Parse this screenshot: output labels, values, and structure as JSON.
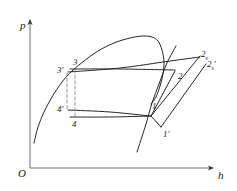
{
  "figure": {
    "type": "thermodynamic-ph-diagram",
    "background_color": "#ffffff",
    "line_color": "#262626",
    "dashed_color": "#7a7a7a"
  },
  "axes": {
    "y_label": "p",
    "x_label": "h",
    "origin_label": "O",
    "y_arrow": "up-arrow",
    "x_arrow": "right-arrow"
  },
  "point_labels": [
    {
      "id": "3prime",
      "text": "3",
      "prime": "′",
      "sub": "",
      "x": 57,
      "y": 66
    },
    {
      "id": "3",
      "text": "3",
      "prime": "",
      "sub": "",
      "x": 73,
      "y": 58
    },
    {
      "id": "4prime",
      "text": "4",
      "prime": "′",
      "sub": "",
      "x": 57,
      "y": 105
    },
    {
      "id": "4",
      "text": "4",
      "prime": "",
      "sub": "",
      "x": 72,
      "y": 120
    },
    {
      "id": "1",
      "text": "1",
      "prime": "",
      "sub": "",
      "x": 152,
      "y": 102
    },
    {
      "id": "1prime",
      "text": "1",
      "prime": "′",
      "sub": "",
      "x": 163,
      "y": 130
    },
    {
      "id": "2",
      "text": "2",
      "prime": "",
      "sub": "",
      "x": 178,
      "y": 72
    },
    {
      "id": "2s",
      "text": "2",
      "prime": "",
      "sub": "s",
      "x": 201,
      "y": 50
    },
    {
      "id": "2sprime",
      "text": "2",
      "prime": "′",
      "sub": "s",
      "x": 207,
      "y": 60
    }
  ],
  "chart_data": {
    "type": "line",
    "title": "",
    "xlabel": "h",
    "ylabel": "p",
    "grid": false,
    "legend": "none",
    "series": [
      {
        "name": "saturation-dome",
        "comment": "two-phase dome: saturated liquid branch left, saturated vapour branch right",
        "points": [
          [
            34,
            143
          ],
          [
            38,
            127
          ],
          [
            44,
            112
          ],
          [
            52,
            97
          ],
          [
            62,
            82
          ],
          [
            72,
            71
          ],
          [
            84,
            61
          ],
          [
            98,
            51
          ],
          [
            114,
            43
          ],
          [
            130,
            38
          ],
          [
            143,
            36
          ],
          [
            152,
            37
          ],
          [
            158,
            41
          ],
          [
            162,
            50
          ],
          [
            164,
            62
          ],
          [
            163,
            74
          ],
          [
            160,
            86
          ],
          [
            156,
            97
          ],
          [
            151,
            104
          ]
        ]
      },
      {
        "name": "isentrope-through-1",
        "comment": "steep line through state 1 extending below",
        "points": [
          [
            137,
            152
          ],
          [
            146,
            124
          ],
          [
            152,
            103
          ],
          [
            159,
            84
          ],
          [
            167,
            63
          ],
          [
            176,
            46
          ]
        ]
      },
      {
        "name": "line-3prime-to-2s",
        "comment": "upper near-horizontal condensing line rising slightly to 2s",
        "points": [
          [
            68,
            72
          ],
          [
            120,
            68
          ],
          [
            170,
            61
          ],
          [
            200,
            57
          ]
        ]
      },
      {
        "name": "line-3-to-2",
        "comment": "upper horizontal condensing line ending at state 2",
        "points": [
          [
            70,
            69
          ],
          [
            120,
            69
          ],
          [
            175,
            70
          ]
        ]
      },
      {
        "name": "line-4prime-to-1",
        "comment": "lower evaporating line from 4' to 1",
        "points": [
          [
            68,
            110
          ],
          [
            110,
            112
          ],
          [
            150,
            116
          ]
        ]
      },
      {
        "name": "line-4-to-1",
        "comment": "lower evaporating line from 4 to 1",
        "points": [
          [
            70,
            117
          ],
          [
            110,
            117
          ],
          [
            151,
            116
          ]
        ]
      },
      {
        "name": "compression-1-to-2",
        "comment": "actual compression from 1 to 2",
        "points": [
          [
            151,
            116
          ],
          [
            175,
            71
          ]
        ]
      },
      {
        "name": "compression-1-to-2s",
        "comment": "isentropic compression from 1 to 2s",
        "points": [
          [
            151,
            116
          ],
          [
            200,
            56
          ]
        ]
      },
      {
        "name": "compression-1prime-to-2sprime",
        "comment": "isentropic compression from 1' to 2s'",
        "points": [
          [
            161,
            127
          ],
          [
            206,
            64
          ]
        ]
      },
      {
        "name": "throttle-1-to-1prime",
        "comment": "short segment from 1 down to 1'",
        "points": [
          [
            151,
            116
          ],
          [
            161,
            127
          ]
        ]
      },
      {
        "name": "expansion-3prime-to-4prime",
        "comment": "vertical dashed expansion line 3' to 4'",
        "dashed": true,
        "points": [
          [
            67,
            73
          ],
          [
            67,
            110
          ]
        ]
      },
      {
        "name": "expansion-3-to-4",
        "comment": "vertical dashed expansion line 3 to 4",
        "dashed": true,
        "points": [
          [
            75,
            70
          ],
          [
            75,
            117
          ]
        ]
      }
    ]
  }
}
